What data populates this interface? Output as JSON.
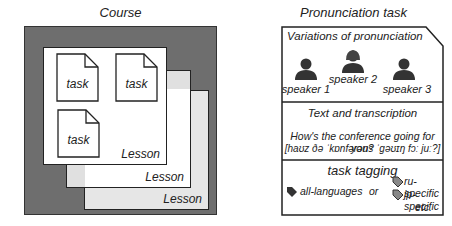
{
  "left_panel": {
    "title": "Course",
    "lessons": [
      {
        "label": "Lesson"
      },
      {
        "label": "Lesson"
      },
      {
        "label": "Lesson"
      }
    ],
    "tasks": [
      {
        "label": "task"
      },
      {
        "label": "task"
      },
      {
        "label": "task"
      }
    ]
  },
  "right_panel": {
    "title": "Pronunciation task",
    "variations": {
      "heading": "Variations of pronunciation",
      "speakers": [
        {
          "label": "speaker 1",
          "icon": "person-icon"
        },
        {
          "label": "speaker 2",
          "icon": "person-female-icon"
        },
        {
          "label": "speaker 3",
          "icon": "person-icon"
        }
      ]
    },
    "text": {
      "heading": "Text and transcription",
      "sentence": "How's the conference going for you?",
      "transcription": "[haʊz ðə ˈkɒnfərəns ˈgəʊɪŋ fɔː juː?]"
    },
    "tagging": {
      "heading": "task tagging",
      "all_tag": "all-languages",
      "or": "or",
      "specific_tags": [
        "ru-specific",
        "jp-specific"
      ],
      "etc": "etc."
    }
  },
  "colors": {
    "course_bg": "#6e6e6e",
    "lesson_back": "#e0e0e0",
    "line": "#222222",
    "icon": "#333333"
  }
}
